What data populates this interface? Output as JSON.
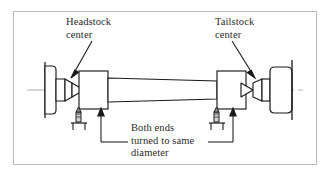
{
  "figure": {
    "type": "engineering-diagram",
    "background_color": "#ffffff",
    "frame_color": "#b9b9b9",
    "line_color": "#1a1a1a",
    "centerline_color": "#b0b0b0",
    "text_color": "#2b2b2b"
  },
  "labels": {
    "headstock": {
      "line1": "Headstock",
      "line2": "center"
    },
    "tailstock": {
      "line1": "Tailstock",
      "line2": "center"
    },
    "both_ends": {
      "line1": "Both ends",
      "line2": "turned to same",
      "line3": "diameter"
    }
  },
  "parts": [
    {
      "id": "headstock-spindle-nose",
      "label": "Headstock spindle nose"
    },
    {
      "id": "headstock-center-cone",
      "label": "Headstock center"
    },
    {
      "id": "workpiece-left-end",
      "label": "Left turned end"
    },
    {
      "id": "workpiece-shaft",
      "label": "Slender workpiece shaft"
    },
    {
      "id": "workpiece-right-end",
      "label": "Right turned end"
    },
    {
      "id": "tailstock-center-cone",
      "label": "Tailstock center"
    },
    {
      "id": "tailstock-quill",
      "label": "Tailstock quill"
    },
    {
      "id": "tailstock-body",
      "label": "Tailstock body"
    },
    {
      "id": "cutting-tool-left",
      "label": "Left cutting tool and tool post"
    },
    {
      "id": "cutting-tool-right",
      "label": "Right cutting tool and tool post"
    },
    {
      "id": "center-line",
      "label": "Axis center line"
    }
  ]
}
